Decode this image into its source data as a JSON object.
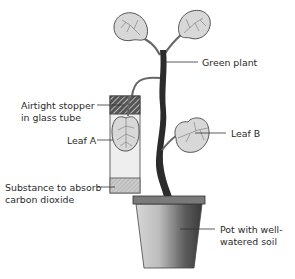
{
  "diagram": {
    "labels": {
      "green_plant": "Green plant",
      "stopper_line1": "Airtight stopper",
      "stopper_line2": "in glass tube",
      "leaf_a": "Leaf A",
      "leaf_b": "Leaf B",
      "absorb_line1": "Substance to absorb",
      "absorb_line2": "carbon dioxide",
      "pot_line1": "Pot with well-",
      "pot_line2": "watered soil"
    },
    "colors": {
      "stem": "#2b2b2b",
      "leaf_fill": "#d8d8d8",
      "outline": "#555555",
      "tube_fill": "#eeeeee",
      "pot_dark": "#4a4a4a",
      "pot_light": "#e0e0e0"
    }
  }
}
